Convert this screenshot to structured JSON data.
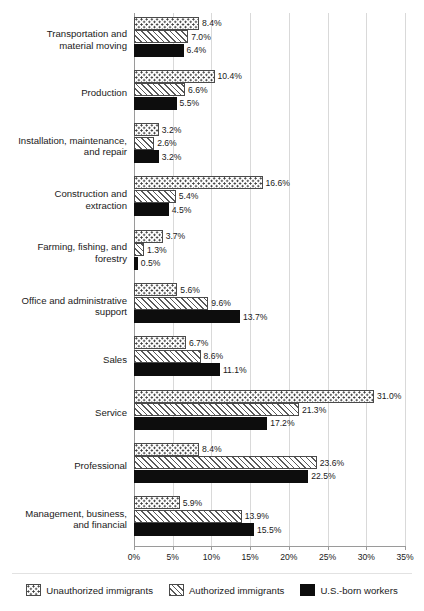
{
  "chart_data": {
    "type": "bar",
    "orientation": "horizontal",
    "title": "",
    "xlabel": "",
    "ylabel": "",
    "xlim": [
      0,
      35
    ],
    "xticks": [
      "0%",
      "5%",
      "10%",
      "15%",
      "20%",
      "25%",
      "30%",
      "35%"
    ],
    "xtick_values": [
      0,
      5,
      10,
      15,
      20,
      25,
      30,
      35
    ],
    "grid": true,
    "legend_position": "bottom",
    "value_suffix": "%",
    "categories": [
      "Transportation and material moving",
      "Production",
      "Installation, maintenance, and repair",
      "Construction and extraction",
      "Farming, fishing, and forestry",
      "Office and administrative support",
      "Sales",
      "Service",
      "Professional",
      "Management, business, and financial"
    ],
    "category_lines": [
      [
        "Transportation and",
        "material moving"
      ],
      [
        "Production"
      ],
      [
        "Installation, maintenance,",
        "and repair"
      ],
      [
        "Construction and",
        "extraction"
      ],
      [
        "Farming, fishing, and",
        "forestry"
      ],
      [
        "Office and administrative",
        "support"
      ],
      [
        "Sales"
      ],
      [
        "Service"
      ],
      [
        "Professional"
      ],
      [
        "Management, business,",
        "and financial"
      ]
    ],
    "series": [
      {
        "name": "Unauthorized immigrants",
        "pattern": "dotted",
        "values": [
          8.4,
          10.4,
          3.2,
          16.6,
          3.7,
          5.6,
          6.7,
          31.0,
          8.4,
          5.9
        ],
        "labels": [
          "8.4%",
          "10.4%",
          "3.2%",
          "16.6%",
          "3.7%",
          "5.6%",
          "6.7%",
          "31.0%",
          "8.4%",
          "5.9%"
        ]
      },
      {
        "name": "Authorized immigrants",
        "pattern": "hatched",
        "values": [
          7.0,
          6.6,
          2.6,
          5.4,
          1.3,
          9.6,
          8.6,
          21.3,
          23.6,
          13.9
        ],
        "labels": [
          "7.0%",
          "6.6%",
          "2.6%",
          "5.4%",
          "1.3%",
          "9.6%",
          "8.6%",
          "21.3%",
          "23.6%",
          "13.9%"
        ]
      },
      {
        "name": "U.S.-born workers",
        "pattern": "solid",
        "values": [
          6.4,
          5.5,
          3.2,
          4.5,
          0.5,
          13.7,
          11.1,
          17.2,
          22.5,
          15.5
        ],
        "labels": [
          "6.4%",
          "5.5%",
          "3.2%",
          "4.5%",
          "0.5%",
          "13.7%",
          "11.1%",
          "17.2%",
          "22.5%",
          "15.5%"
        ]
      }
    ]
  },
  "legend": {
    "items": [
      {
        "label": "Unauthorized immigrants",
        "pattern": "dotted"
      },
      {
        "label": "Authorized immigrants",
        "pattern": "hatched"
      },
      {
        "label": "U.S.-born workers",
        "pattern": "solid"
      }
    ]
  },
  "colors": {
    "bar_solid": "#0d0d0d",
    "bar_outline": "#4a4a4a",
    "gridline": "#d9d9d9",
    "axis": "#9a9a9a",
    "text": "#1a1a1a",
    "background": "#ffffff"
  }
}
